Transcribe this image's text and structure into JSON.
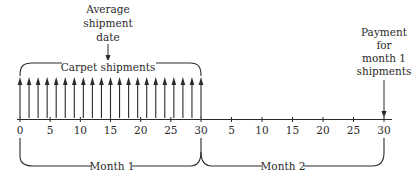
{
  "diagram": {
    "type": "timeline",
    "colors": {
      "ink": "#2a2a2a",
      "background": "#ffffff"
    },
    "annotations": {
      "average_shipment": [
        "Average",
        "shipment",
        "date"
      ],
      "carpet_shipments": "Carpet shipments",
      "payment": [
        "Payment",
        "for",
        "month 1",
        "shipments"
      ]
    },
    "axis": {
      "month1_ticks": [
        "0",
        "5",
        "10",
        "15",
        "20",
        "25",
        "30"
      ],
      "month2_ticks": [
        "5",
        "10",
        "15",
        "20",
        "25",
        "30"
      ]
    },
    "periods": {
      "month1": "Month 1",
      "month2": "Month 2"
    },
    "shipment_arrow_count": 21
  }
}
